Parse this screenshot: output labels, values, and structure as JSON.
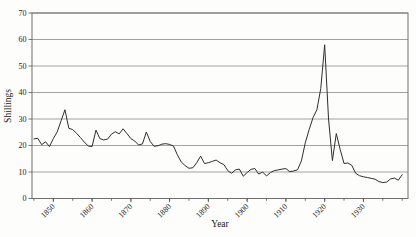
{
  "page": {
    "background": "#fdfdfc"
  },
  "chart_data": {
    "type": "line",
    "title": "",
    "xlabel": "Year",
    "ylabel": "Shillings",
    "x_range": [
      1844.5,
      1941.5
    ],
    "y_range": [
      0,
      70
    ],
    "y_ticks": [
      0,
      10,
      20,
      30,
      40,
      50,
      60,
      70
    ],
    "x_major_ticks": [
      1850,
      1860,
      1870,
      1880,
      1890,
      1900,
      1910,
      1920,
      1930
    ],
    "x_minor_tick_start": 1845,
    "x_minor_tick_end": 1940,
    "x_minor_tick_interval": 5,
    "grid": "horizontal",
    "legend": "none",
    "frame": true,
    "colors": {
      "line": "#2e2e2e",
      "grid": "#8a8a8a",
      "frame": "#6e6e6e",
      "tick": "#555555",
      "text": "#1c1c1c"
    },
    "series": [
      {
        "name": "Shillings",
        "points": [
          [
            1845,
            22.5
          ],
          [
            1846,
            22.7
          ],
          [
            1847,
            20.3
          ],
          [
            1848,
            21.4
          ],
          [
            1849,
            19.6
          ],
          [
            1850,
            22.6
          ],
          [
            1851,
            25.1
          ],
          [
            1852,
            29.3
          ],
          [
            1853,
            33.5
          ],
          [
            1854,
            26.5
          ],
          [
            1855,
            26.0
          ],
          [
            1856,
            24.6
          ],
          [
            1857,
            23.0
          ],
          [
            1858,
            21.3
          ],
          [
            1859,
            19.8
          ],
          [
            1860,
            19.6
          ],
          [
            1861,
            25.8
          ],
          [
            1862,
            22.6
          ],
          [
            1863,
            22.1
          ],
          [
            1864,
            22.4
          ],
          [
            1865,
            24.3
          ],
          [
            1866,
            25.2
          ],
          [
            1867,
            24.4
          ],
          [
            1868,
            26.3
          ],
          [
            1869,
            24.5
          ],
          [
            1870,
            22.6
          ],
          [
            1871,
            21.7
          ],
          [
            1872,
            20.2
          ],
          [
            1873,
            20.6
          ],
          [
            1874,
            25.1
          ],
          [
            1875,
            21.5
          ],
          [
            1876,
            19.7
          ],
          [
            1877,
            19.9
          ],
          [
            1878,
            20.5
          ],
          [
            1879,
            20.7
          ],
          [
            1880,
            20.4
          ],
          [
            1881,
            19.8
          ],
          [
            1882,
            16.5
          ],
          [
            1883,
            13.8
          ],
          [
            1884,
            12.4
          ],
          [
            1885,
            11.4
          ],
          [
            1886,
            11.6
          ],
          [
            1887,
            13.5
          ],
          [
            1888,
            16.0
          ],
          [
            1889,
            13.2
          ],
          [
            1890,
            13.5
          ],
          [
            1891,
            14.0
          ],
          [
            1892,
            14.5
          ],
          [
            1893,
            13.5
          ],
          [
            1894,
            12.8
          ],
          [
            1895,
            10.5
          ],
          [
            1896,
            9.5
          ],
          [
            1897,
            10.8
          ],
          [
            1898,
            11.1
          ],
          [
            1899,
            8.4
          ],
          [
            1900,
            9.8
          ],
          [
            1901,
            11.0
          ],
          [
            1902,
            11.3
          ],
          [
            1903,
            9.2
          ],
          [
            1904,
            10.0
          ],
          [
            1905,
            8.5
          ],
          [
            1906,
            9.8
          ],
          [
            1907,
            10.5
          ],
          [
            1908,
            10.8
          ],
          [
            1909,
            11.1
          ],
          [
            1910,
            11.3
          ],
          [
            1911,
            10.1
          ],
          [
            1912,
            10.4
          ],
          [
            1913,
            10.8
          ],
          [
            1914,
            14.2
          ],
          [
            1915,
            21.0
          ],
          [
            1916,
            26.0
          ],
          [
            1917,
            30.5
          ],
          [
            1918,
            33.5
          ],
          [
            1919,
            41.5
          ],
          [
            1920,
            58.0
          ],
          [
            1921,
            30.0
          ],
          [
            1922,
            14.3
          ],
          [
            1923,
            24.5
          ],
          [
            1924,
            18.5
          ],
          [
            1925,
            13.2
          ],
          [
            1926,
            13.4
          ],
          [
            1927,
            12.5
          ],
          [
            1928,
            9.5
          ],
          [
            1929,
            8.6
          ],
          [
            1930,
            8.2
          ],
          [
            1931,
            7.9
          ],
          [
            1932,
            7.6
          ],
          [
            1933,
            7.3
          ],
          [
            1934,
            6.4
          ],
          [
            1935,
            6.0
          ],
          [
            1936,
            6.2
          ],
          [
            1937,
            7.4
          ],
          [
            1938,
            7.7
          ],
          [
            1939,
            6.9
          ],
          [
            1940,
            9.0
          ]
        ]
      }
    ]
  }
}
